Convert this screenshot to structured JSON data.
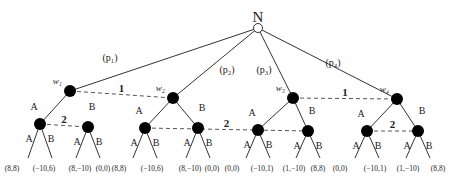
{
  "diagram": {
    "type": "extensive-form game tree",
    "root": {
      "label": "N",
      "x": 258,
      "y": 28
    },
    "nature_branches": [
      {
        "label": "(p₁)",
        "to": "w1",
        "lx": 110,
        "ly": 61
      },
      {
        "label": "(p₂)",
        "to": "w2",
        "lx": 227,
        "ly": 73
      },
      {
        "label": "(p₃)",
        "to": "w3",
        "lx": 264,
        "ly": 73
      },
      {
        "label": "(p₄)",
        "to": "w4",
        "lx": 333,
        "ly": 66
      }
    ],
    "player1_nodes": [
      {
        "id": "w1",
        "label": "w₁",
        "x": 70,
        "y": 91
      },
      {
        "id": "w2",
        "label": "w₂",
        "x": 173,
        "y": 98
      },
      {
        "id": "w3",
        "label": "w₃",
        "x": 293,
        "y": 98
      },
      {
        "id": "w4",
        "label": "w₄",
        "x": 397,
        "y": 99
      }
    ],
    "info_sets_player1": [
      {
        "label": "1",
        "from": "w1",
        "to": "w2"
      },
      {
        "label": "1",
        "from": "w3",
        "to": "w4"
      }
    ],
    "player2_nodes": [
      {
        "id": "a1",
        "x": 40,
        "y": 124,
        "parent": "w1",
        "action": "A",
        "edge_drawn": true
      },
      {
        "id": "b1",
        "x": 88,
        "y": 127,
        "parent": "w1",
        "action": "B",
        "edge_drawn": false
      },
      {
        "id": "a2",
        "x": 145,
        "y": 128,
        "parent": "w2",
        "action": "A",
        "edge_drawn": true
      },
      {
        "id": "b2",
        "x": 198,
        "y": 128,
        "parent": "w2",
        "action": "B",
        "edge_drawn": true
      },
      {
        "id": "a3",
        "x": 258,
        "y": 130,
        "parent": "w3",
        "action": "A",
        "edge_drawn": true
      },
      {
        "id": "b3",
        "x": 308,
        "y": 131,
        "parent": "w3",
        "action": "B",
        "edge_drawn": true
      },
      {
        "id": "a4",
        "x": 367,
        "y": 131,
        "parent": "w4",
        "action": "A",
        "edge_drawn": true
      },
      {
        "id": "b4",
        "x": 418,
        "y": 131,
        "parent": "w4",
        "action": "B",
        "edge_drawn": true
      }
    ],
    "info_sets_player2": [
      {
        "label": "2",
        "from": "a1",
        "to": "b1"
      },
      {
        "label": "2",
        "from": "a2",
        "to": "b3"
      },
      {
        "label": "2",
        "from": "a4",
        "to": "b4"
      }
    ],
    "actions": {
      "A": "A",
      "B": "B"
    },
    "payoffs": [
      "(8,8)",
      "(−10,6)",
      "(8,−10)",
      "(0,0)",
      "(8,8)",
      "(−10,6)",
      "(8,−10)",
      "(0,0)",
      "(0,0)",
      "(−10,1)",
      "(1,−10)",
      "(8,8)",
      "(0,0)",
      "(−10,1)",
      "(1,−10)",
      "(8,8)"
    ],
    "colors": {
      "line": "#333333",
      "node_fill": "#000000",
      "dash": "#555555",
      "text": "#222222"
    }
  }
}
